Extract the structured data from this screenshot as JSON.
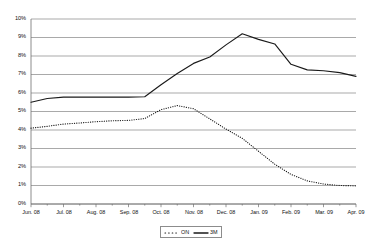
{
  "chart_data": {
    "type": "line",
    "title": "",
    "subtitle": "",
    "xlabel": "",
    "ylabel": "",
    "ylim": [
      0,
      10
    ],
    "yunit": "%",
    "grid": true,
    "grid_axis": "y",
    "legend_position": "bottom-center",
    "categories": [
      "Jun. 08",
      "Jul. 08",
      "Aug. 08",
      "Sep. 08",
      "Oct. 08",
      "Nov. 08",
      "Dec. 08",
      "Jan. 09",
      "Feb. 09",
      "Mar. 09",
      "Apr. 09"
    ],
    "ytick_labels": [
      "0%",
      "1%",
      "2%",
      "3%",
      "4%",
      "5%",
      "6%",
      "7%",
      "8%",
      "9%",
      "10%"
    ],
    "ytick_values": [
      0,
      1,
      2,
      3,
      4,
      5,
      6,
      7,
      8,
      9,
      10
    ],
    "series": [
      {
        "name": "ON",
        "style": "dotted",
        "color": "#1a1a1a",
        "x": [
          "Jun. 08",
          "Jun. 08",
          "Jul. 08",
          "Jul. 08",
          "Aug. 08",
          "Aug. 08",
          "Sep. 08",
          "Sep. 08",
          "Oct. 08",
          "Oct. 08",
          "Nov. 08",
          "Nov. 08",
          "Dec. 08",
          "Dec. 08",
          "Jan. 09",
          "Jan. 09",
          "Feb. 09",
          "Feb. 09",
          "Mar. 09",
          "Mar. 09",
          "Apr. 09"
        ],
        "values": [
          4.1,
          4.2,
          4.32,
          4.38,
          4.45,
          4.5,
          4.52,
          4.62,
          5.1,
          5.32,
          5.15,
          4.6,
          4.05,
          3.55,
          2.85,
          2.15,
          1.6,
          1.25,
          1.08,
          1.0,
          0.98
        ]
      },
      {
        "name": "3M",
        "style": "solid",
        "color": "#1a1a1a",
        "x": [
          "Jun. 08",
          "Jun. 08",
          "Jul. 08",
          "Jul. 08",
          "Aug. 08",
          "Aug. 08",
          "Sep. 08",
          "Sep. 08",
          "Oct. 08",
          "Oct. 08",
          "Nov. 08",
          "Nov. 08",
          "Dec. 08",
          "Dec. 08",
          "Jan. 09",
          "Jan. 09",
          "Feb. 09",
          "Feb. 09",
          "Mar. 09",
          "Mar. 09",
          "Apr. 09"
        ],
        "values": [
          5.5,
          5.7,
          5.78,
          5.78,
          5.78,
          5.78,
          5.78,
          5.8,
          6.45,
          7.05,
          7.6,
          7.95,
          8.6,
          9.2,
          8.9,
          8.65,
          7.55,
          7.25,
          7.2,
          7.1,
          6.9
        ]
      }
    ],
    "legend": [
      {
        "label": "ON",
        "style": "dotted"
      },
      {
        "label": "3M",
        "style": "solid"
      }
    ]
  },
  "geometry": {
    "plot_left": 31,
    "plot_right": 356,
    "plot_top": 19,
    "plot_bottom": 204
  }
}
